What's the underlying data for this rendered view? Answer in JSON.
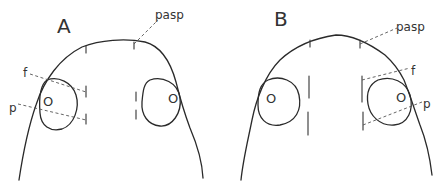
{
  "figure": {
    "panels": [
      {
        "id": "A",
        "label": "A",
        "annotations": {
          "pasp": "pasp",
          "f": "f",
          "p": "p"
        },
        "nostril_glyph": "O"
      },
      {
        "id": "B",
        "label": "B",
        "annotations": {
          "pasp": "pasp",
          "f": "f",
          "p": "p"
        },
        "nostril_glyph": "O"
      }
    ],
    "colors": {
      "line": "#2a2a2a",
      "dashed": "#555555",
      "background": "#ffffff"
    }
  }
}
